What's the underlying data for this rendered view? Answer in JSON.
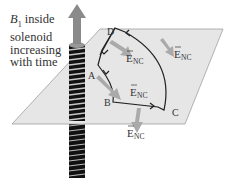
{
  "caption": {
    "line1_symbol": "B",
    "line1_sub": "1",
    "line1_rest": " inside",
    "line2": "solenoid",
    "line3": "increasing",
    "line4": "with time"
  },
  "points": {
    "A": "A",
    "B": "B",
    "C": "C",
    "D": "D"
  },
  "field_labels": {
    "e1": "E",
    "e1_sub": "NC",
    "e2": "E",
    "e2_sub": "NC",
    "e3": "E",
    "e3_sub": "NC",
    "e4": "E",
    "e4_sub": "NC"
  },
  "colors": {
    "plane": "#e4e4e4",
    "plane_edge": "#9a9a9a",
    "arrow": "#a8a8a8",
    "path": "#222222",
    "coil": "#2a2a2a"
  }
}
